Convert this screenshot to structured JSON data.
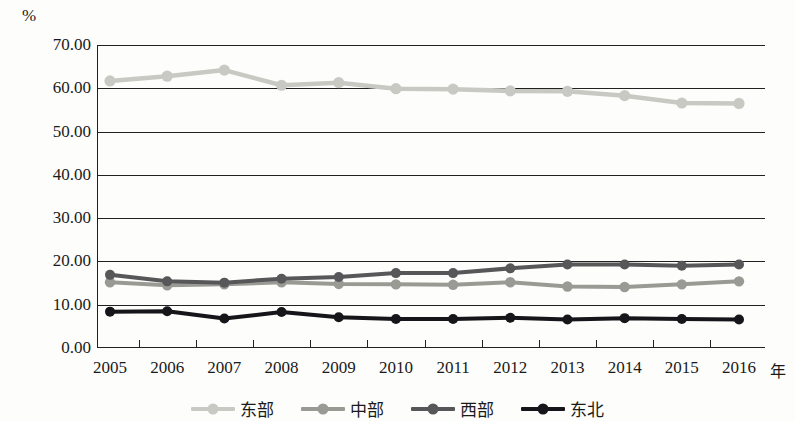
{
  "chart_data": {
    "type": "line",
    "title": "",
    "subtitle": "",
    "xlabel": "年",
    "ylabel": "%",
    "unit_label": "%",
    "categories": [
      "2005",
      "2006",
      "2007",
      "2008",
      "2009",
      "2010",
      "2011",
      "2012",
      "2013",
      "2014",
      "2015",
      "2016"
    ],
    "x": [
      2005,
      2006,
      2007,
      2008,
      2009,
      2010,
      2011,
      2012,
      2013,
      2014,
      2015,
      2016
    ],
    "ylim": [
      0,
      70
    ],
    "yticks": [
      "0.00",
      "10.00",
      "20.00",
      "30.00",
      "40.00",
      "50.00",
      "60.00",
      "70.00"
    ],
    "ytick_values": [
      0,
      10,
      20,
      30,
      40,
      50,
      60,
      70
    ],
    "grid": true,
    "legend_position": "bottom",
    "series": [
      {
        "name": "东部",
        "color": "#c9c9c4",
        "values": [
          61.7,
          62.8,
          64.2,
          60.7,
          61.3,
          59.9,
          59.8,
          59.4,
          59.3,
          58.3,
          56.6,
          56.5
        ]
      },
      {
        "name": "中部",
        "color": "#9a9a95",
        "values": [
          15.2,
          14.5,
          14.7,
          15.2,
          14.8,
          14.7,
          14.6,
          15.2,
          14.2,
          14.1,
          14.7,
          15.4
        ]
      },
      {
        "name": "西部",
        "color": "#57575a",
        "values": [
          16.9,
          15.4,
          15.1,
          16.0,
          16.4,
          17.3,
          17.3,
          18.4,
          19.3,
          19.3,
          19.0,
          19.3
        ]
      },
      {
        "name": "东北",
        "color": "#15151a",
        "values": [
          8.4,
          8.5,
          6.8,
          8.3,
          7.1,
          6.7,
          6.7,
          7.0,
          6.6,
          6.9,
          6.7,
          6.6
        ]
      }
    ]
  },
  "legend": {
    "items": [
      {
        "label": "东部",
        "color": "#c9c9c4"
      },
      {
        "label": "中部",
        "color": "#9a9a95"
      },
      {
        "label": "西部",
        "color": "#57575a"
      },
      {
        "label": "东北",
        "color": "#15151a"
      }
    ]
  },
  "axes": {
    "y_unit": "%",
    "x_unit": "年"
  }
}
